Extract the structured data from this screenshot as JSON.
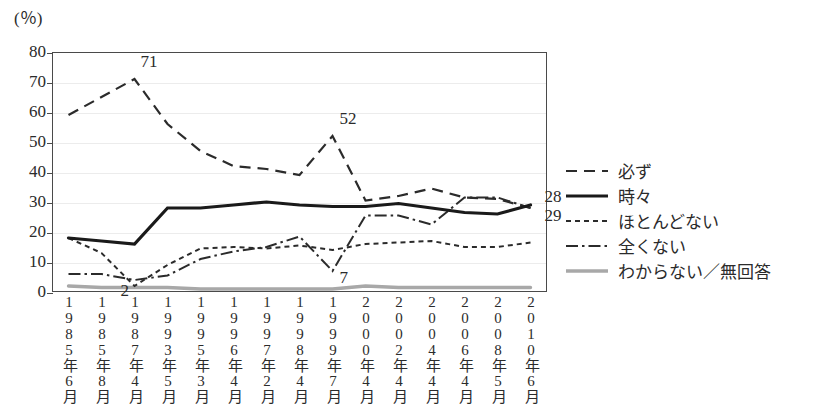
{
  "chart_data": {
    "type": "line",
    "title": "",
    "xlabel": "",
    "ylabel": "(％)",
    "ylim": [
      0,
      80
    ],
    "ytick_step": 10,
    "yticks": [
      0,
      10,
      20,
      30,
      40,
      50,
      60,
      70,
      80
    ],
    "grid": true,
    "legend_position": "right",
    "categories": [
      "1985年6月",
      "1985年8月",
      "1987年4月",
      "1993年5月",
      "1995年3月",
      "1996年4月",
      "1997年2月",
      "1998年4月",
      "1999年7月",
      "2000年4月",
      "2002年4月",
      "2004年4月",
      "2006年4月",
      "2008年5月",
      "2010年6月"
    ],
    "series": [
      {
        "name": "必ず",
        "style": "dashed",
        "color": "#2b2b2b",
        "values": [
          59,
          65,
          71,
          56,
          47,
          42,
          41,
          39,
          52,
          30.5,
          32,
          34.5,
          31.5,
          31,
          28
        ]
      },
      {
        "name": "時々",
        "style": "solid-bold",
        "color": "#1a1a1a",
        "values": [
          18,
          17,
          16,
          28,
          28,
          29,
          30,
          29,
          28.5,
          28.5,
          29.5,
          28,
          26.5,
          26,
          29
        ]
      },
      {
        "name": "ほとんどない",
        "style": "dotted",
        "color": "#2b2b2b",
        "values": [
          18,
          13,
          2,
          9,
          14.5,
          15,
          14.5,
          15.5,
          14,
          16,
          16.5,
          17,
          15,
          15,
          16.5
        ]
      },
      {
        "name": "全くない",
        "style": "dash-dot",
        "color": "#2b2b2b",
        "values": [
          6,
          6,
          4,
          5.5,
          11,
          13.5,
          15,
          18.5,
          7,
          25.5,
          25.5,
          22.5,
          31.5,
          31.5,
          28
        ]
      },
      {
        "name": "わからない／無回答",
        "style": "solid-gray",
        "color": "#a8a8a8",
        "values": [
          2,
          1.5,
          1.5,
          1.5,
          1,
          1,
          1,
          1,
          1,
          2,
          1.5,
          1.5,
          1.5,
          1.5,
          1.5
        ]
      }
    ],
    "annotations": [
      {
        "label": "71",
        "series": "必ず",
        "category": "1987年4月",
        "value": 71
      },
      {
        "label": "52",
        "series": "必ず",
        "category": "1999年7月",
        "value": 52
      },
      {
        "label": "28",
        "series": "全くない",
        "category": "2010年6月",
        "value": 28
      },
      {
        "label": "29",
        "series": "時々",
        "category": "2010年6月",
        "value": 29
      },
      {
        "label": "2",
        "series": "ほとんどない",
        "category": "1987年4月",
        "value": 2
      },
      {
        "label": "7",
        "series": "全くない",
        "category": "1999年7月",
        "value": 7
      }
    ]
  },
  "legend": {
    "items": [
      {
        "label": "必ず",
        "style": "dashed"
      },
      {
        "label": "時々",
        "style": "solid-bold"
      },
      {
        "label": "ほとんどない",
        "style": "dotted"
      },
      {
        "label": "全くない",
        "style": "dash-dot"
      },
      {
        "label": "わからない／無回答",
        "style": "solid-gray"
      }
    ]
  }
}
